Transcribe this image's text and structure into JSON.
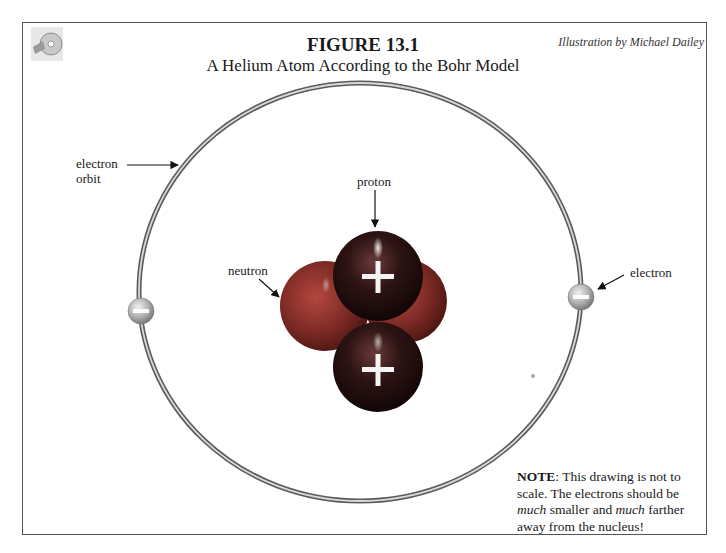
{
  "figure": {
    "number": "FIGURE 13.1",
    "title": "A Helium Atom According to the Bohr Model",
    "credit": "Illustration by Michael Dailey"
  },
  "labels": {
    "electron_orbit_line1": "electron",
    "electron_orbit_line2": "orbit",
    "proton": "proton",
    "neutron": "neutron",
    "electron": "electron"
  },
  "particles": {
    "proton_sign": "+",
    "electron_sign": "−",
    "proton_count": 2,
    "neutron_count": 2,
    "electron_count": 2
  },
  "note": {
    "bold_lead": "NOTE",
    "text_1": ": This drawing is not to scale.  The electrons should be ",
    "emph_1": "much",
    "text_2": " smaller and ",
    "emph_2": "much",
    "text_3": " farther away from the nucleus!"
  },
  "colors": {
    "proton": "#3a1a1a",
    "neutron": "#8a2e2a",
    "electron": "#b5b5b5",
    "orbit": "#6e6e6e"
  }
}
